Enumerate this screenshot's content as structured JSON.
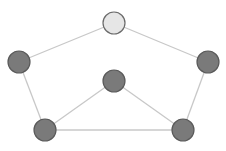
{
  "diagram": {
    "type": "graph",
    "colors": {
      "background": "#ffffff",
      "edge": "#c8c8c8",
      "node_fill": "#7a7a7a",
      "node_stroke": "#5a5a5a",
      "highlight_fill": "#e6e6e6",
      "highlight_stroke": "#6a6a6a"
    },
    "nodes": [
      {
        "id": "top",
        "x": 114,
        "y": 23,
        "r": 11,
        "highlighted": true
      },
      {
        "id": "left",
        "x": 19,
        "y": 62,
        "r": 11,
        "highlighted": false
      },
      {
        "id": "right",
        "x": 208,
        "y": 62,
        "r": 11,
        "highlighted": false
      },
      {
        "id": "center",
        "x": 114,
        "y": 81,
        "r": 11,
        "highlighted": false
      },
      {
        "id": "bottom-left",
        "x": 45,
        "y": 130,
        "r": 11,
        "highlighted": false
      },
      {
        "id": "bottom-right",
        "x": 183,
        "y": 130,
        "r": 11,
        "highlighted": false
      }
    ],
    "edges": [
      [
        "top",
        "left"
      ],
      [
        "top",
        "right"
      ],
      [
        "left",
        "bottom-left"
      ],
      [
        "right",
        "bottom-right"
      ],
      [
        "center",
        "bottom-left"
      ],
      [
        "center",
        "bottom-right"
      ],
      [
        "bottom-left",
        "bottom-right"
      ]
    ]
  }
}
